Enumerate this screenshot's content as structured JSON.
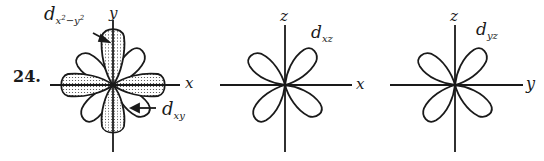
{
  "problem_number": "24.",
  "diagrams": [
    {
      "id": "dxy_dx2y2",
      "axes": {
        "horizontal": "x",
        "vertical": "y"
      },
      "orbitals": [
        {
          "main": "d",
          "sub_base": "x",
          "sub_sup1": "2",
          "sub_minus": "−y",
          "sub_sup2": "2",
          "shaded": true,
          "lobes_along": "axes"
        },
        {
          "main": "d",
          "sub": "xy",
          "shaded": false,
          "lobes_along": "diagonals"
        }
      ]
    },
    {
      "id": "dxz",
      "axes": {
        "horizontal": "x",
        "vertical": "z"
      },
      "orbital": {
        "main": "d",
        "sub": "xz",
        "lobes_along": "diagonals"
      }
    },
    {
      "id": "dyz",
      "axes": {
        "horizontal": "y",
        "vertical": "z"
      },
      "orbital": {
        "main": "d",
        "sub": "yz",
        "lobes_along": "diagonals"
      }
    }
  ],
  "colors": {
    "ink": "#1a1a1a",
    "background": "#ffffff",
    "stipple": "#555555"
  }
}
